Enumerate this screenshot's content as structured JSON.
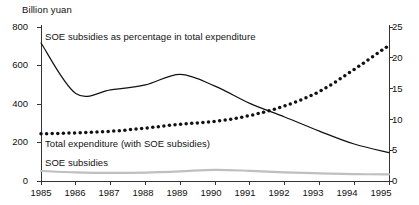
{
  "chart_data": {
    "type": "line",
    "title": "",
    "ylabel": "Billion yuan",
    "ylabel_right": "",
    "xlabel": "",
    "grid": false,
    "legend_position": "inline-annotations",
    "x": [
      1985,
      1986,
      1987,
      1988,
      1989,
      1990,
      1991,
      1992,
      1993,
      1994,
      1995
    ],
    "categories": [
      "1985",
      "1986",
      "1987",
      "1988",
      "1989",
      "1990",
      "1991",
      "1992",
      "1993",
      "1994",
      "1995"
    ],
    "ylim": [
      0,
      800
    ],
    "yticks": [
      0,
      200,
      400,
      600,
      800
    ],
    "ylim_right": [
      0,
      25
    ],
    "yticks_right": [
      0,
      5,
      10,
      15,
      20,
      25
    ],
    "series": [
      {
        "name": "SOE subsidies as percentage in total expenditure",
        "axis": "right",
        "unit": "percent",
        "style": "solid",
        "color": "#111111",
        "values": [
          22.4,
          14.2,
          14.8,
          15.6,
          17.3,
          15.4,
          12.6,
          10.4,
          8.1,
          6.0,
          4.6
        ]
      },
      {
        "name": "Total expenditure (with SOE subsidies)",
        "axis": "left",
        "unit": "billion yuan",
        "style": "dotted",
        "color": "#111111",
        "values": [
          245,
          250,
          258,
          275,
          295,
          310,
          340,
          390,
          465,
          580,
          705
        ]
      },
      {
        "name": "SOE subsidies",
        "axis": "left",
        "unit": "billion yuan",
        "style": "solid",
        "color": "#bfbfbf",
        "values": [
          52,
          45,
          42,
          44,
          50,
          58,
          53,
          45,
          40,
          36,
          34
        ]
      }
    ],
    "annotations": [
      {
        "text": "SOE subsidies as percentage in total expenditure",
        "x": 1985.6,
        "y_axis": "right",
        "y": 24.0
      },
      {
        "text": "Total expenditure (with SOE subsidies)",
        "x": 1985.6,
        "y_axis": "left",
        "y": 205
      },
      {
        "text": "SOE subsidies",
        "x": 1985.6,
        "y_axis": "left",
        "y": 108
      }
    ]
  },
  "axes": {
    "left_ticks": [
      "800",
      "600",
      "400",
      "200",
      "0"
    ],
    "right_ticks": [
      "25",
      "20",
      "15",
      "10",
      "5",
      "0"
    ],
    "x_ticks": [
      "1985",
      "1986",
      "1987",
      "1988",
      "1989",
      "1990",
      "1991",
      "1992",
      "1993",
      "1994",
      "1995"
    ],
    "unit_label": "Billion yuan"
  },
  "labels": {
    "percentage_series": "SOE subsidies as percentage in total expenditure",
    "total_expenditure_series": "Total expenditure (with SOE subsidies)",
    "soe_subsidies_series": "SOE subsidies"
  }
}
